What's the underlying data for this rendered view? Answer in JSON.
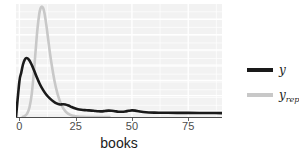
{
  "axes": {
    "xlabel": "books",
    "xticks": [
      "0",
      "25",
      "50",
      "75"
    ]
  },
  "legend": {
    "entries": [
      {
        "label": "y",
        "sub": "",
        "color": "#1a1a1a",
        "key_name": "legend-key-y"
      },
      {
        "label": "y",
        "sub": "rep",
        "color": "#c8c8c8",
        "key_name": "legend-key-yrep"
      }
    ]
  },
  "colors": {
    "panel_background": "#f2f2f2",
    "grid": "#ffffff",
    "observed": "#1a1a1a",
    "replicated": "#c8c8c8",
    "axis": "#4d4d4d"
  },
  "chart_data": {
    "type": "line",
    "title": "",
    "subtitle": "",
    "xlabel": "books",
    "ylabel": "",
    "xlim": [
      -1.5,
      90
    ],
    "ylim": [
      0,
      0.185
    ],
    "grid": true,
    "legend_position": "right",
    "annotations": [],
    "tick_labels": {
      "x": [
        "0",
        "25",
        "50",
        "75"
      ],
      "y": []
    },
    "series": [
      {
        "name": "y",
        "color": "#1a1a1a",
        "linewidth": 2.6,
        "x": [
          -1.5,
          0,
          0.8,
          1.6,
          2.4,
          3.2,
          4.2,
          5.2,
          6.4,
          7.6,
          9,
          10.5,
          12,
          13.5,
          15,
          16.5,
          18,
          19.2,
          20.4,
          21.8,
          23.2,
          24.6,
          26,
          27.5,
          29,
          30.5,
          32,
          33.5,
          35,
          36.5,
          38,
          39.5,
          41,
          42.5,
          44,
          45.5,
          47,
          48.5,
          50,
          51.5,
          53,
          55,
          57.5,
          60,
          63,
          66,
          70,
          75,
          80,
          85,
          90
        ],
        "y": [
          0.0,
          0.058,
          0.072,
          0.086,
          0.094,
          0.0965,
          0.094,
          0.0875,
          0.0775,
          0.0665,
          0.0545,
          0.0445,
          0.0365,
          0.0305,
          0.0258,
          0.0222,
          0.0205,
          0.0208,
          0.0206,
          0.0188,
          0.0163,
          0.0142,
          0.0128,
          0.0119,
          0.0113,
          0.0109,
          0.0105,
          0.0099,
          0.0093,
          0.0092,
          0.0098,
          0.0104,
          0.0102,
          0.0094,
          0.0087,
          0.0086,
          0.0091,
          0.0101,
          0.0108,
          0.0104,
          0.0094,
          0.0082,
          0.0074,
          0.0071,
          0.007,
          0.0069,
          0.0068,
          0.0067,
          0.0066,
          0.0065,
          0.0064
        ]
      },
      {
        "name": "y_rep",
        "color": "#c8c8c8",
        "linewidth": 2.6,
        "x": [
          1.5,
          2.5,
          3.5,
          4.5,
          5.5,
          6.5,
          7.2,
          8.0,
          8.8,
          9.4,
          10.0,
          10.6,
          11.2,
          12.0,
          12.8,
          13.6,
          14.6,
          15.6,
          16.8,
          18.0,
          19.2,
          20.4,
          21.6,
          23.0,
          24.5,
          26,
          28,
          30,
          33,
          36,
          40
        ],
        "y": [
          0.0,
          0.002,
          0.006,
          0.016,
          0.038,
          0.076,
          0.108,
          0.143,
          0.168,
          0.178,
          0.181,
          0.178,
          0.169,
          0.15,
          0.127,
          0.104,
          0.08,
          0.059,
          0.04,
          0.026,
          0.016,
          0.0095,
          0.0055,
          0.003,
          0.0015,
          0.0008,
          0.0003,
          0.0001,
          0.0,
          0.0,
          0.0
        ]
      }
    ]
  }
}
